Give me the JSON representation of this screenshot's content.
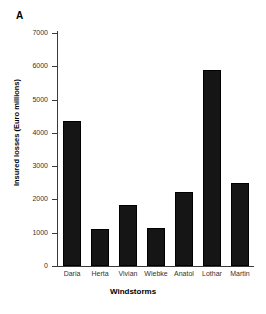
{
  "figure": {
    "panel_label": "A",
    "background_color": "#ffffff",
    "bar_color": "#151515",
    "axis_color": "#3a3a3a"
  },
  "chart_data": {
    "type": "bar",
    "title": "",
    "subtitle": "",
    "panel": "A",
    "categories": [
      "Daria",
      "Herta",
      "Vivian",
      "Wiebke",
      "Anatol",
      "Lothar",
      "Martin"
    ],
    "values": [
      4350,
      1100,
      1830,
      1150,
      2230,
      5900,
      2500
    ],
    "xlabel": "Windstorms",
    "ylabel": "Insured losses (Euro millions)",
    "ylim": [
      0,
      7000
    ],
    "ytick_values": [
      0,
      1000,
      2000,
      3000,
      4000,
      5000,
      6000,
      7000
    ],
    "ytick_labels": [
      "0",
      "1000",
      "2000",
      "3000",
      "4000",
      "5000",
      "6000",
      "7000"
    ],
    "grid": false,
    "legend": null,
    "legend_position": "none",
    "annotations": []
  }
}
